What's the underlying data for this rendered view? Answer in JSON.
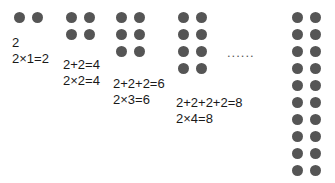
{
  "figure": {
    "title": "",
    "dot_color": "#555555",
    "text_color": "#1a1a1a",
    "background_color": "#ffffff",
    "ellipsis": "......",
    "groups": [
      {
        "id": "group-1",
        "rows": 1,
        "cols": 2,
        "total_dots": 2,
        "lines": [
          "2",
          "2×1=2"
        ],
        "addition": "2",
        "multiplication": "2×1=2",
        "product": 2
      },
      {
        "id": "group-2",
        "rows": 2,
        "cols": 2,
        "total_dots": 4,
        "lines": [
          "2+2=4",
          "2×2=4"
        ],
        "addition": "2+2=4",
        "multiplication": "2×2=4",
        "product": 4
      },
      {
        "id": "group-3",
        "rows": 3,
        "cols": 2,
        "total_dots": 6,
        "lines": [
          "2+2+2=6",
          "2×3=6"
        ],
        "addition": "2+2+2=6",
        "multiplication": "2×3=6",
        "product": 6
      },
      {
        "id": "group-4",
        "rows": 4,
        "cols": 2,
        "total_dots": 8,
        "lines": [
          "2+2+2+2=8",
          "2×4=8"
        ],
        "addition": "2+2+2+2=8",
        "multiplication": "2×4=8",
        "product": 8
      },
      {
        "id": "group-5",
        "rows": 10,
        "cols": 2,
        "total_dots": 20,
        "lines": [],
        "addition": "",
        "multiplication": "",
        "product": 20
      }
    ]
  }
}
